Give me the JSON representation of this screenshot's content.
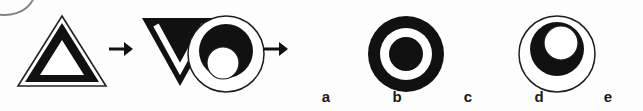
{
  "page": {
    "type": "visual-analogy-puzzle",
    "background_color": "#fdfdfd",
    "ink_color": "#111111",
    "width": 643,
    "height": 111
  },
  "prompt": {
    "relation_separator": ":",
    "arrow_glyph": "→",
    "pair_one": {
      "source": {
        "name": "triangle-outline-figure",
        "description": "upright thin triangle outline containing a thick black triangular band with white interior"
      },
      "target": {
        "name": "inverted-solid-triangle-figure",
        "description": "inverted solid black triangle with a thin white inverted-V line inside"
      }
    },
    "pair_two": {
      "source": {
        "name": "circle-with-offset-crescent-figure",
        "description": "thin circle outline containing a black disc offset upward with a white disc inside its lower part"
      },
      "target": {
        "name": "unknown-answer",
        "description": "missing figure to be chosen from the options"
      }
    }
  },
  "options": [
    {
      "id": "a",
      "label": "a",
      "name": "option-a-bullseye",
      "description": "thick black ring with white gap and solid black concentric centre"
    },
    {
      "id": "b",
      "label": "b",
      "name": "option-b-crescent-light-outline",
      "description": "thin circle outline containing a black disc in the upper area with a white disc offset up-right inside it"
    },
    {
      "id": "c",
      "label": "c",
      "name": "option-c-solid-with-inner-crescent",
      "description": "large solid black disc containing a white disc with a black disc offset upward inside it"
    },
    {
      "id": "d",
      "label": "d",
      "name": "option-d-annulus",
      "description": "thin circle outline with a thick black ring and white centre"
    },
    {
      "id": "e",
      "label": "e",
      "name": "option-e-solid-with-lower-crescent",
      "description": "large solid black disc containing a white disc low-centre with a black disc offset down-left inside it"
    }
  ]
}
